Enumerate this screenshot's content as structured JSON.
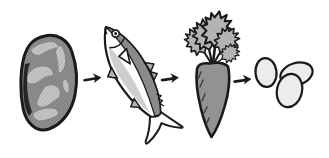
{
  "illustration": {
    "description": "hand-drawn food sequence: meat to fish to carrot to eggs",
    "arrow_symbol": "→",
    "arrow_count": 3,
    "sequence": [
      {
        "name": "meat",
        "icon": "meat-icon"
      },
      {
        "name": "fish",
        "icon": "fish-icon"
      },
      {
        "name": "carrot",
        "icon": "carrot-icon"
      },
      {
        "name": "eggs",
        "icon": "eggs-icon"
      }
    ],
    "colors": {
      "background": "#ffffff",
      "outline": "#1a1a1a",
      "meat_fill": "#8c8c8c",
      "meat_marbling": "#c4c4c4",
      "meat_shadow": "#262626",
      "fish_back": "#8a8a8a",
      "fish_belly": "#fdfdfd",
      "fish_shading": "#c9c9c9",
      "fish_fin": "#b5b5b5",
      "carrot_body": "#929292",
      "carrot_leaves": "#b3b3b3",
      "egg_fill": "#ececec"
    }
  }
}
